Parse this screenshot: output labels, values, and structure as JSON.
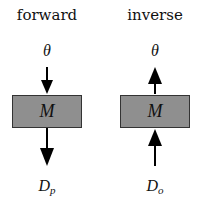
{
  "forward": {
    "title": "forward",
    "input_symbol": "θ",
    "model_label": "M",
    "output_symbol_base": "D",
    "output_symbol_sub": "p",
    "arrow_direction": "down"
  },
  "inverse": {
    "title": "inverse",
    "input_symbol": "θ",
    "model_label": "M",
    "output_symbol_base": "D",
    "output_symbol_sub": "o",
    "arrow_direction": "up"
  },
  "colors": {
    "box_fill": "#8f8f8f",
    "box_border": "#333333",
    "arrow": "#000000"
  }
}
